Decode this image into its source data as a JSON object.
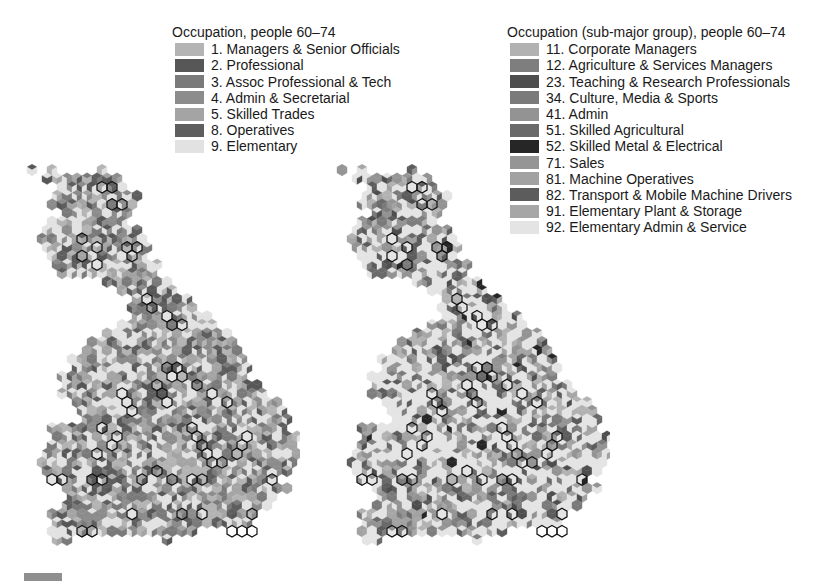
{
  "chart_data": [
    {
      "type": "hex-cartogram",
      "title": "Occupation, people 60–74",
      "legend": [
        {
          "code": "1",
          "label": "1. Managers & Senior Officials",
          "color": "#b4b4b4"
        },
        {
          "code": "2",
          "label": "2. Professional",
          "color": "#575757"
        },
        {
          "code": "3",
          "label": "3. Assoc Professional & Tech",
          "color": "#7a7a7a"
        },
        {
          "code": "4",
          "label": "4. Admin & Secretarial",
          "color": "#8c8c8c"
        },
        {
          "code": "5",
          "label": "5. Skilled Trades",
          "color": "#a4a4a4"
        },
        {
          "code": "8",
          "label": "8. Operatives",
          "color": "#5e5e5e"
        },
        {
          "code": "9",
          "label": "9. Elementary",
          "color": "#e2e2e2"
        }
      ],
      "region": "Great Britain",
      "cell_shape": "hexagon split into three rhombi",
      "boundaries": {
        "city": "black outline",
        "region": "white outline"
      }
    },
    {
      "type": "hex-cartogram",
      "title": "Occupation (sub-major group), people 60–74",
      "legend": [
        {
          "code": "11",
          "label": "11. Corporate Managers",
          "color": "#b2b2b2"
        },
        {
          "code": "12",
          "label": "12. Agriculture & Services Managers",
          "color": "#7e7e7e"
        },
        {
          "code": "23",
          "label": "23. Teaching & Research Professionals",
          "color": "#4e4e4e"
        },
        {
          "code": "34",
          "label": "34. Culture, Media & Sports",
          "color": "#7a7a7a"
        },
        {
          "code": "41",
          "label": "41. Admin",
          "color": "#939393"
        },
        {
          "code": "51",
          "label": "51. Skilled Agricultural",
          "color": "#6a6a6a"
        },
        {
          "code": "52",
          "label": "52. Skilled Metal & Electrical",
          "color": "#262626"
        },
        {
          "code": "71",
          "label": "71. Sales",
          "color": "#959595"
        },
        {
          "code": "81",
          "label": "81. Machine Operatives",
          "color": "#a2a2a2"
        },
        {
          "code": "82",
          "label": "82. Transport & Mobile Machine Drivers",
          "color": "#5c5c5c"
        },
        {
          "code": "91",
          "label": "91. Elementary Plant & Storage",
          "color": "#a6a6a6"
        },
        {
          "code": "92",
          "label": "92. Elementary Admin & Service",
          "color": "#e4e4e4"
        }
      ],
      "region": "Great Britain",
      "cell_shape": "hexagon split into three rhombi",
      "boundaries": {
        "city": "black outline",
        "region": "white outline"
      }
    }
  ],
  "left": {
    "title": "Occupation, people 60–74",
    "items": [
      "1. Managers & Senior Officials",
      "2. Professional",
      "3. Assoc Professional & Tech",
      "4. Admin & Secretarial",
      "5. Skilled Trades",
      "8. Operatives",
      "9. Elementary"
    ],
    "colors": [
      "#b4b4b4",
      "#575757",
      "#7a7a7a",
      "#8c8c8c",
      "#a4a4a4",
      "#5e5e5e",
      "#e2e2e2"
    ],
    "dominant_weights": [
      0.14,
      0.06,
      0.12,
      0.14,
      0.16,
      0.08,
      0.3
    ]
  },
  "right": {
    "title": "Occupation (sub-major group), people 60–74",
    "items": [
      "11. Corporate Managers",
      "12. Agriculture & Services Managers",
      "23. Teaching & Research Professionals",
      "34. Culture, Media & Sports",
      "41. Admin",
      "51. Skilled Agricultural",
      "52. Skilled Metal & Electrical",
      "71. Sales",
      "81. Machine Operatives",
      "82. Transport & Mobile Machine Drivers",
      "91. Elementary Plant & Storage",
      "92. Elementary Admin & Service"
    ],
    "colors": [
      "#b2b2b2",
      "#7e7e7e",
      "#4e4e4e",
      "#7a7a7a",
      "#939393",
      "#6a6a6a",
      "#262626",
      "#959595",
      "#a2a2a2",
      "#5c5c5c",
      "#a6a6a6",
      "#e4e4e4"
    ],
    "dominant_weights": [
      0.08,
      0.05,
      0.04,
      0.05,
      0.07,
      0.04,
      0.01,
      0.05,
      0.05,
      0.06,
      0.05,
      0.45
    ]
  },
  "hexgrid": {
    "hex_width": 10,
    "row_height": 8.6,
    "rows": [
      [
        3,
        3,
        8,
        8
      ],
      [
        3,
        9
      ],
      [
        4,
        10
      ],
      [
        3,
        11
      ],
      [
        3,
        11
      ],
      [
        4,
        10
      ],
      [
        3,
        10
      ],
      [
        2,
        11
      ],
      [
        2,
        12
      ],
      [
        2,
        12
      ],
      [
        3,
        12
      ],
      [
        3,
        13
      ],
      [
        4,
        13
      ],
      [
        8,
        14
      ],
      [
        10,
        15
      ],
      [
        11,
        16
      ],
      [
        11,
        17
      ],
      [
        11,
        18
      ],
      [
        10,
        19
      ],
      [
        8,
        20
      ],
      [
        7,
        21
      ],
      [
        6,
        21
      ],
      [
        5,
        22
      ],
      [
        5,
        22
      ],
      [
        4,
        22
      ],
      [
        4,
        23
      ],
      [
        4,
        24
      ],
      [
        5,
        25
      ],
      [
        6,
        26
      ],
      [
        6,
        26
      ],
      [
        3,
        26
      ],
      [
        3,
        27
      ],
      [
        3,
        27
      ],
      [
        2,
        27
      ],
      [
        2,
        27
      ],
      [
        2,
        26
      ],
      [
        3,
        25
      ],
      [
        4,
        26
      ],
      [
        5,
        25
      ],
      [
        4,
        24
      ],
      [
        3,
        23
      ],
      [
        3,
        22
      ],
      [
        3,
        17
      ],
      [
        3,
        4,
        14,
        14
      ]
    ],
    "isolated": [
      [
        2,
        1
      ],
      [
        1,
        0
      ],
      [
        7,
        1
      ],
      [
        12,
        40
      ]
    ],
    "city_outlines_left": [
      [
        8,
        2
      ],
      [
        9,
        2
      ],
      [
        9,
        4
      ],
      [
        10,
        4
      ],
      [
        6,
        8
      ],
      [
        7,
        9
      ],
      [
        6,
        10
      ],
      [
        7,
        11
      ],
      [
        10,
        9
      ],
      [
        11,
        9
      ],
      [
        11,
        10
      ],
      [
        12,
        15
      ],
      [
        13,
        16
      ],
      [
        14,
        17
      ],
      [
        15,
        18
      ],
      [
        16,
        18
      ],
      [
        14,
        23
      ],
      [
        15,
        23
      ],
      [
        15,
        24
      ],
      [
        16,
        24
      ],
      [
        17,
        25
      ],
      [
        10,
        26
      ],
      [
        10,
        27
      ],
      [
        11,
        28
      ],
      [
        13,
        25
      ],
      [
        14,
        26
      ],
      [
        14,
        27
      ],
      [
        19,
        26
      ],
      [
        20,
        27
      ],
      [
        8,
        30
      ],
      [
        9,
        31
      ],
      [
        9,
        32
      ],
      [
        7,
        33
      ],
      [
        17,
        30
      ],
      [
        17,
        31
      ],
      [
        18,
        32
      ],
      [
        18,
        33
      ],
      [
        19,
        34
      ],
      [
        20,
        34
      ],
      [
        21,
        33
      ],
      [
        22,
        32
      ],
      [
        22,
        31
      ],
      [
        3,
        36
      ],
      [
        4,
        36
      ],
      [
        7,
        36
      ],
      [
        8,
        36
      ],
      [
        12,
        36
      ],
      [
        13,
        35
      ],
      [
        15,
        36
      ],
      [
        17,
        36
      ],
      [
        18,
        36
      ],
      [
        25,
        36
      ],
      [
        11,
        40
      ],
      [
        16,
        40
      ],
      [
        18,
        40
      ],
      [
        23,
        40
      ],
      [
        6,
        42
      ],
      [
        7,
        42
      ],
      [
        21,
        42
      ],
      [
        22,
        42
      ],
      [
        23,
        42
      ]
    ],
    "city_outlines_right": [
      [
        8,
        2
      ],
      [
        9,
        2
      ],
      [
        9,
        4
      ],
      [
        10,
        4
      ],
      [
        6,
        8
      ],
      [
        7,
        9
      ],
      [
        6,
        10
      ],
      [
        7,
        11
      ],
      [
        10,
        9
      ],
      [
        11,
        9
      ],
      [
        11,
        10
      ],
      [
        12,
        15
      ],
      [
        13,
        16
      ],
      [
        14,
        17
      ],
      [
        15,
        18
      ],
      [
        16,
        18
      ],
      [
        14,
        23
      ],
      [
        15,
        23
      ],
      [
        15,
        24
      ],
      [
        16,
        24
      ],
      [
        17,
        25
      ],
      [
        10,
        26
      ],
      [
        10,
        27
      ],
      [
        11,
        28
      ],
      [
        13,
        25
      ],
      [
        14,
        26
      ],
      [
        14,
        27
      ],
      [
        19,
        26
      ],
      [
        20,
        27
      ],
      [
        8,
        30
      ],
      [
        9,
        31
      ],
      [
        9,
        32
      ],
      [
        7,
        33
      ],
      [
        17,
        30
      ],
      [
        17,
        31
      ],
      [
        18,
        32
      ],
      [
        18,
        33
      ],
      [
        19,
        34
      ],
      [
        20,
        34
      ],
      [
        21,
        33
      ],
      [
        22,
        32
      ],
      [
        22,
        31
      ],
      [
        3,
        36
      ],
      [
        4,
        36
      ],
      [
        7,
        36
      ],
      [
        8,
        36
      ],
      [
        12,
        36
      ],
      [
        13,
        35
      ],
      [
        15,
        36
      ],
      [
        17,
        36
      ],
      [
        18,
        36
      ],
      [
        25,
        36
      ],
      [
        11,
        40
      ],
      [
        16,
        40
      ],
      [
        18,
        40
      ],
      [
        23,
        40
      ],
      [
        6,
        42
      ],
      [
        7,
        42
      ],
      [
        21,
        42
      ],
      [
        22,
        42
      ],
      [
        23,
        42
      ]
    ]
  },
  "footer": {
    "scale_bar": "scale bar"
  }
}
